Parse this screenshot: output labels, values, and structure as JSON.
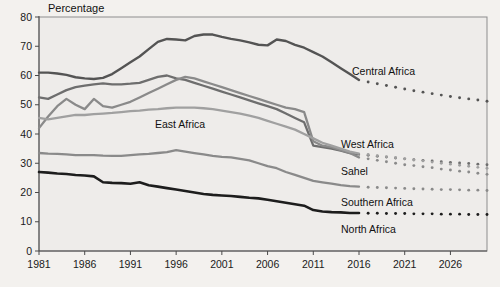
{
  "figure": {
    "y_axis_title": "Percentage",
    "background_note": "scanned book page, faint show-through text"
  },
  "ghost_text": "the components of the  ·  in the region and to better  ·  the continuing consumption  ·  and overall  ·  resilience of populations exposed  ·  and  ·  to the  ·  the share of  ·  in the  ·  is likely to be  ·  which has been  ·  for many  ·  is shown in  ·  the proportion of the population  ·  per year  ·  declining  ·  than in 1991 it is still the  ·  of Africa  ·  in 1995 the  ·  2000 were  ·  however  ·  still  ·  2011  ·",
  "axes": {
    "x_ticks": [
      "1981",
      "1986",
      "1991",
      "1996",
      "2001",
      "2006",
      "2011",
      "2016",
      "2021",
      "2026"
    ],
    "x_min": 1981,
    "x_max": 2030,
    "y_ticks": [
      "0",
      "10",
      "20",
      "30",
      "40",
      "50",
      "60",
      "70",
      "80"
    ],
    "y_min": 0,
    "y_max": 80
  },
  "labels": [
    {
      "name": "central-africa",
      "text": "Central Africa",
      "x": 352,
      "y": 75
    },
    {
      "name": "east-africa",
      "text": "East Africa",
      "x": 155,
      "y": 128
    },
    {
      "name": "west-africa",
      "text": "West Africa",
      "x": 341,
      "y": 148
    },
    {
      "name": "sahel",
      "text": "Sahel",
      "x": 341,
      "y": 175
    },
    {
      "name": "southern-africa",
      "text": "Southern Africa",
      "x": 341,
      "y": 206
    },
    {
      "name": "north-africa",
      "text": "North Africa",
      "x": 341,
      "y": 233
    }
  ],
  "colors": {
    "north_africa": "#1d1d1d",
    "central_africa": "#545454",
    "west_africa": "#6e6e6e",
    "sahel": "#8a8a8a",
    "east_africa": "#a0a0a0",
    "southern_africa": "#8a8a8a",
    "frame": "#8d8d8d",
    "axis": "#4a4a4a",
    "plot_bg": "#eeecea",
    "page_bg": "#f3f1ee"
  },
  "chart_data": {
    "type": "line",
    "title": "",
    "subtitle": "",
    "xlabel": "",
    "ylabel": "Percentage",
    "ylim": [
      0,
      80
    ],
    "xlim": [
      1981,
      2030
    ],
    "grid": false,
    "legend": "inline-labels-at-line-ends",
    "annotations": [
      "Dotted segments from 2017 onward are projections"
    ],
    "x": [
      1981,
      1982,
      1983,
      1984,
      1985,
      1986,
      1987,
      1988,
      1989,
      1990,
      1991,
      1992,
      1993,
      1994,
      1995,
      1996,
      1997,
      1998,
      1999,
      2000,
      2001,
      2002,
      2003,
      2004,
      2005,
      2006,
      2007,
      2008,
      2009,
      2010,
      2011,
      2012,
      2013,
      2014,
      2015,
      2016
    ],
    "x_projected": [
      2017,
      2018,
      2019,
      2020,
      2021,
      2022,
      2023,
      2024,
      2025,
      2026,
      2027,
      2028,
      2029,
      2030
    ],
    "series": [
      {
        "name": "Central Africa",
        "color": "#545454",
        "width": 2.4,
        "values": [
          61.0,
          61.0,
          60.7,
          60.2,
          59.4,
          59.0,
          58.8,
          59.2,
          60.5,
          62.5,
          64.5,
          66.5,
          69.0,
          71.5,
          72.5,
          72.3,
          72.0,
          73.5,
          74.0,
          74.0,
          73.2,
          72.5,
          72.0,
          71.3,
          70.5,
          70.3,
          72.3,
          71.8,
          70.5,
          69.5,
          68.0,
          66.5,
          64.5,
          62.5,
          60.5,
          58.5
        ],
        "projected": [
          57.8,
          57.2,
          56.6,
          56.0,
          55.4,
          54.8,
          54.3,
          53.8,
          53.3,
          52.8,
          52.4,
          52.0,
          51.6,
          51.2
        ]
      },
      {
        "name": "West Africa",
        "color": "#6e6e6e",
        "width": 2.3,
        "values": [
          52.5,
          52.0,
          53.5,
          55.0,
          56.0,
          56.5,
          57.0,
          57.3,
          57.0,
          57.0,
          57.2,
          57.5,
          58.5,
          59.5,
          60.0,
          59.0,
          58.5,
          57.5,
          56.5,
          55.5,
          54.5,
          53.5,
          52.5,
          51.5,
          50.5,
          49.5,
          48.5,
          47.0,
          45.5,
          44.0,
          36.0,
          35.5,
          35.0,
          34.3,
          33.5,
          33.0
        ],
        "projected": [
          32.7,
          32.4,
          32.1,
          31.8,
          31.5,
          31.2,
          31.0,
          30.8,
          30.5,
          30.3,
          30.1,
          29.9,
          29.7,
          29.5
        ]
      },
      {
        "name": "Sahel",
        "color": "#8a8a8a",
        "width": 2.3,
        "values": [
          42.0,
          46.0,
          49.5,
          52.0,
          50.0,
          48.5,
          52.0,
          49.5,
          49.0,
          50.0,
          51.0,
          52.5,
          54.0,
          55.5,
          57.0,
          58.5,
          59.5,
          59.0,
          58.0,
          57.0,
          56.0,
          55.0,
          54.0,
          53.0,
          52.0,
          51.0,
          50.0,
          49.0,
          48.5,
          47.5,
          37.5,
          36.0,
          35.5,
          34.5,
          33.5,
          32.0
        ],
        "projected": [
          31.5,
          31.0,
          30.5,
          30.0,
          29.5,
          29.2,
          28.8,
          28.5,
          28.0,
          27.7,
          27.3,
          27.0,
          26.6,
          26.2
        ]
      },
      {
        "name": "East Africa",
        "color": "#a0a0a0",
        "width": 2.3,
        "values": [
          45.5,
          45.0,
          45.5,
          46.0,
          46.5,
          46.5,
          46.8,
          47.0,
          47.2,
          47.5,
          47.8,
          48.0,
          48.3,
          48.5,
          48.8,
          49.0,
          49.0,
          49.0,
          48.8,
          48.5,
          48.0,
          47.5,
          47.0,
          46.3,
          45.5,
          44.5,
          43.5,
          42.5,
          41.5,
          40.0,
          38.5,
          37.0,
          36.0,
          35.0,
          34.0,
          33.3
        ],
        "projected": [
          33.0,
          32.6,
          32.2,
          31.9,
          31.5,
          31.1,
          30.8,
          30.4,
          30.0,
          29.7,
          29.3,
          29.0,
          28.6,
          28.3
        ]
      },
      {
        "name": "Southern Africa",
        "color": "#8a8a8a",
        "width": 2.3,
        "values": [
          33.5,
          33.3,
          33.2,
          33.0,
          32.8,
          32.8,
          32.8,
          32.6,
          32.5,
          32.5,
          32.8,
          33.0,
          33.2,
          33.5,
          33.8,
          34.5,
          34.0,
          33.5,
          33.0,
          32.5,
          32.2,
          32.0,
          31.5,
          31.0,
          30.0,
          29.0,
          28.3,
          27.0,
          26.0,
          25.0,
          24.0,
          23.5,
          23.0,
          22.5,
          22.2,
          22.0
        ],
        "projected": [
          21.8,
          21.7,
          21.6,
          21.5,
          21.4,
          21.3,
          21.2,
          21.1,
          21.0,
          21.0,
          20.9,
          20.8,
          20.8,
          20.7
        ]
      },
      {
        "name": "North Africa",
        "color": "#1d1d1d",
        "width": 2.6,
        "values": [
          27.0,
          26.8,
          26.5,
          26.3,
          26.0,
          25.8,
          25.5,
          23.5,
          23.3,
          23.2,
          23.0,
          23.5,
          22.5,
          22.0,
          21.5,
          21.0,
          20.5,
          20.0,
          19.5,
          19.2,
          19.0,
          18.8,
          18.5,
          18.2,
          18.0,
          17.5,
          17.0,
          16.5,
          16.0,
          15.5,
          14.0,
          13.5,
          13.3,
          13.2,
          13.0,
          13.0
        ],
        "projected": [
          12.9,
          12.9,
          12.8,
          12.8,
          12.8,
          12.7,
          12.7,
          12.7,
          12.6,
          12.6,
          12.6,
          12.5,
          12.5,
          12.5
        ]
      }
    ]
  }
}
